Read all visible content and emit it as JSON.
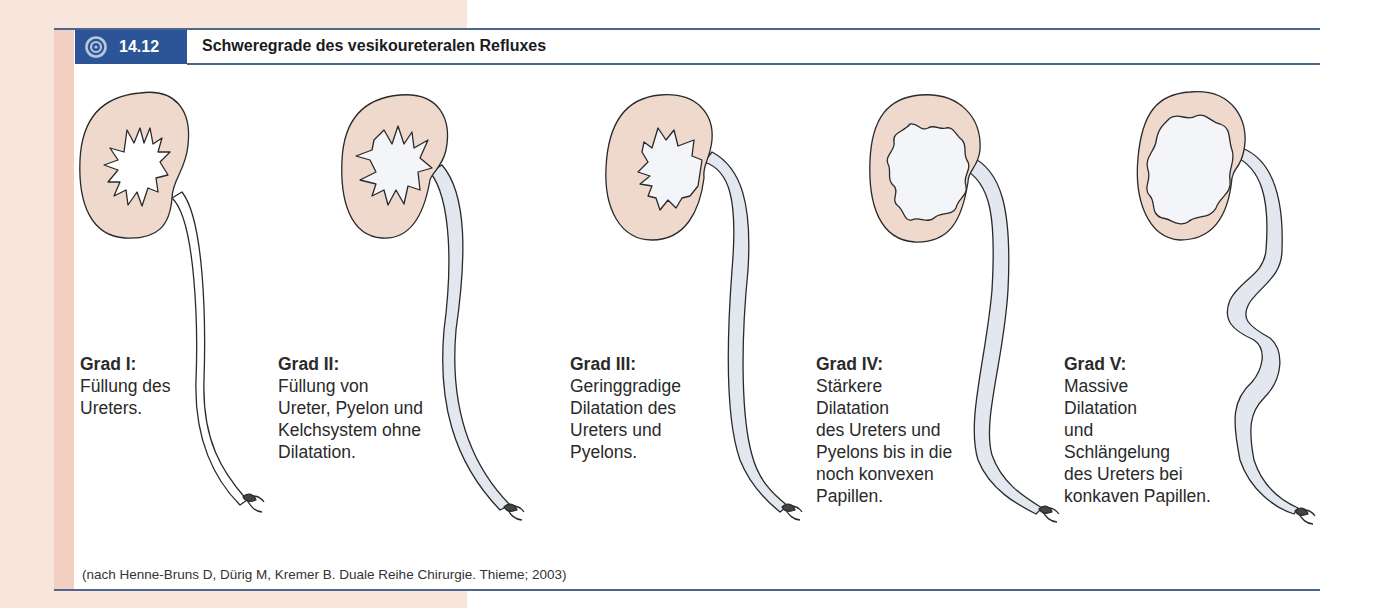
{
  "figure": {
    "number": "14.12",
    "title": "Schweregrade des vesikoureteralen Refluxes",
    "icon": "target-icon",
    "colors": {
      "header_blue": "#2b5597",
      "rule_blue": "#4d6690",
      "kidney_fill": "#efd8cc",
      "ureter_fill": "#e2e7f0",
      "margin_peach": "#f8e6dc",
      "margin_pink": "#f3cfc2"
    }
  },
  "grades": [
    {
      "label": "Grad I:",
      "description": "Füllung des\nUreters."
    },
    {
      "label": "Grad II:",
      "description": "Füllung von\nUreter, Pyelon und\nKelchsystem ohne\nDilatation."
    },
    {
      "label": "Grad III:",
      "description": "Geringgradige\nDilatation des\nUreters und\nPyelons."
    },
    {
      "label": "Grad IV:",
      "description": "Stärkere\nDilatation\ndes Ureters und\nPyelons bis in die\nnoch konvexen\nPapillen."
    },
    {
      "label": "Grad V:",
      "description": "Massive\nDilatation\nund\nSchlängelung\ndes Ureters bei\nkonkaven Papillen."
    }
  ],
  "source": "(nach Henne-Bruns D, Dürig M, Kremer B. Duale Reihe Chirurgie. Thieme; 2003)"
}
